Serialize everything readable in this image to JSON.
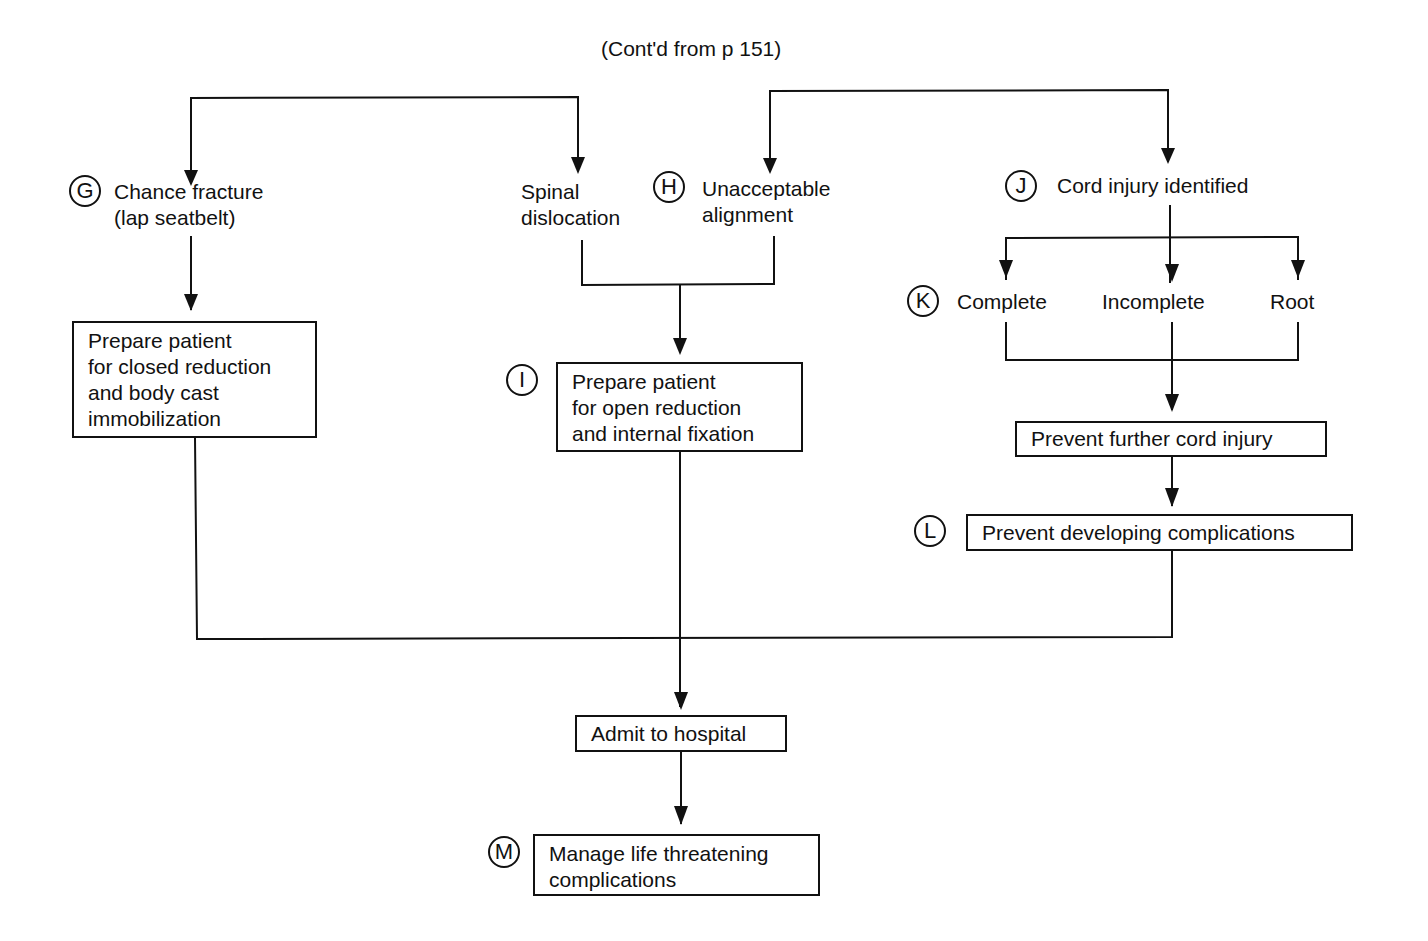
{
  "header": {
    "continuation": "(Cont'd from p 151)"
  },
  "nodes": {
    "G": {
      "marker": "G",
      "label": "Chance fracture\n(lap seatbelt)"
    },
    "spinal": {
      "label": "Spinal\ndislocation"
    },
    "H": {
      "marker": "H",
      "label": "Unacceptable\nalignment"
    },
    "J": {
      "marker": "J",
      "label": "Cord injury identified"
    },
    "K": {
      "marker": "K",
      "complete": "Complete",
      "incomplete": "Incomplete",
      "root": "Root"
    },
    "closed": {
      "label": "Prepare patient\nfor closed reduction\nand body cast\nimmobilization"
    },
    "I": {
      "marker": "I",
      "label": "Prepare patient\nfor open reduction\nand internal fixation"
    },
    "prevent_cord": {
      "label": "Prevent further cord injury"
    },
    "L": {
      "marker": "L",
      "label": "Prevent developing complications"
    },
    "admit": {
      "label": "Admit to hospital"
    },
    "M": {
      "marker": "M",
      "label": "Manage life threatening\ncomplications"
    }
  }
}
